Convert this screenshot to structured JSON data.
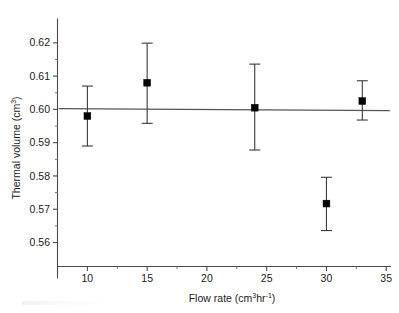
{
  "chart_data": {
    "type": "scatter",
    "title": "",
    "subtitle": "",
    "xlabel_text": "Flow rate (cm",
    "xlabel_sup1": "3",
    "xlabel_mid": "hr",
    "xlabel_sup2": "-1",
    "xlabel_end": ")",
    "xlabel": "Flow rate (cm3hr-1)",
    "ylabel_text": "Thermal volume (cm",
    "ylabel_sup": "3",
    "ylabel_end": ")",
    "ylabel": "Thermal volume (cm3)",
    "xlim": [
      7.5,
      35.4
    ],
    "ylim": [
      0.5528,
      0.6258
    ],
    "grid": false,
    "legend": "none",
    "x_ticks_major": [
      10,
      15,
      20,
      25,
      30,
      35
    ],
    "x_tick_labels": [
      "10",
      "15",
      "20",
      "25",
      "30",
      "35"
    ],
    "x_ticks_minor": [
      12.5,
      17.5,
      22.5,
      27.5,
      32.5
    ],
    "y_ticks_major": [
      0.56,
      0.57,
      0.58,
      0.59,
      0.6,
      0.61,
      0.62
    ],
    "y_tick_labels": [
      "0.56",
      "0.57",
      "0.58",
      "0.59",
      "0.60",
      "0.61",
      "0.62"
    ],
    "y_ticks_minor": [
      0.565,
      0.575,
      0.585,
      0.595,
      0.605,
      0.615
    ],
    "x": [
      10,
      15,
      24,
      30,
      33
    ],
    "y": [
      0.598,
      0.608,
      0.6005,
      0.5717,
      0.6025
    ],
    "y_err_low": [
      0.589,
      0.5958,
      0.5878,
      0.5636,
      0.5968
    ],
    "y_err_high": [
      0.607,
      0.6199,
      0.6136,
      0.5796,
      0.6086
    ],
    "series": [
      {
        "name": "Thermal volume measurements",
        "marker": "filled-square",
        "color": "#000000",
        "points": [
          {
            "x": 10,
            "y": 0.598,
            "err_low": 0.589,
            "err_high": 0.607
          },
          {
            "x": 15,
            "y": 0.608,
            "err_low": 0.5958,
            "err_high": 0.6199
          },
          {
            "x": 24,
            "y": 0.6005,
            "err_low": 0.5878,
            "err_high": 0.6136
          },
          {
            "x": 30,
            "y": 0.5717,
            "err_low": 0.5636,
            "err_high": 0.5796
          },
          {
            "x": 33,
            "y": 0.6025,
            "err_low": 0.5968,
            "err_high": 0.6086
          }
        ]
      }
    ],
    "fit_line": {
      "name": "mean-reference-line",
      "color": "#555555",
      "x_start": 7.6,
      "x_end": 35.3,
      "y_start": 0.6002,
      "y_end": 0.5996
    }
  }
}
